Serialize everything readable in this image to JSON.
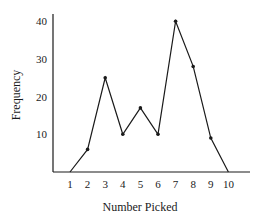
{
  "chart_data": {
    "type": "line",
    "title": "",
    "xlabel": "Number Picked",
    "ylabel": "Frequency",
    "x": [
      1,
      2,
      3,
      4,
      5,
      6,
      7,
      8,
      9,
      10
    ],
    "categories": [
      "1",
      "2",
      "3",
      "4",
      "5",
      "6",
      "7",
      "8",
      "9",
      "10"
    ],
    "series": [
      {
        "name": "Frequency",
        "values": [
          0,
          6,
          25,
          10,
          17,
          10,
          40,
          28,
          9,
          0
        ]
      }
    ],
    "yticks": [
      10,
      20,
      30,
      40
    ],
    "ytick_labels": [
      "10",
      "20",
      "30",
      "40"
    ],
    "ylim": [
      0,
      40
    ],
    "xlim": [
      0,
      11
    ],
    "grid": false,
    "legend": null,
    "markers": true
  },
  "colors": {
    "line": "#1a1a1a",
    "axis": "#1a1a1a"
  }
}
